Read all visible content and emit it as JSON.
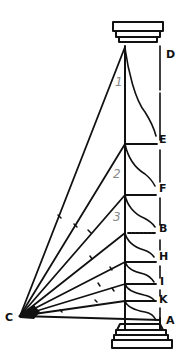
{
  "diagram": {
    "colors": {
      "ink": "#111111",
      "numerals": "#8a8a8a",
      "background": "#ffffff"
    },
    "vertex": {
      "label": "C",
      "x": 20,
      "y": 316
    },
    "column": {
      "axis_x": 125,
      "right_x": 160,
      "top_y": 47,
      "bottom_y": 330,
      "capital": {
        "x": 113,
        "y": 22,
        "width": 50,
        "height": 26
      },
      "base": {
        "x": 112,
        "y": 328,
        "width": 62,
        "height": 28
      }
    },
    "point_labels": [
      {
        "id": "D",
        "text": "D",
        "x": 166,
        "y": 58
      },
      {
        "id": "E",
        "text": "E",
        "x": 159,
        "y": 143
      },
      {
        "id": "F",
        "text": "F",
        "x": 159,
        "y": 192
      },
      {
        "id": "B",
        "text": "B",
        "x": 159,
        "y": 232
      },
      {
        "id": "H",
        "text": "H",
        "x": 159,
        "y": 260
      },
      {
        "id": "I",
        "text": "I",
        "x": 160,
        "y": 285
      },
      {
        "id": "K",
        "text": "K",
        "x": 159,
        "y": 303
      },
      {
        "id": "A",
        "text": "A",
        "x": 166,
        "y": 324
      },
      {
        "id": "C",
        "text": "C",
        "x": 5,
        "y": 321
      }
    ],
    "numerals": [
      {
        "text": "1",
        "x": 115,
        "y": 86
      },
      {
        "text": "2",
        "x": 114,
        "y": 178
      },
      {
        "text": "3",
        "x": 114,
        "y": 221
      }
    ],
    "rays_to_axis_y": [
      48,
      144,
      195,
      233,
      262,
      284,
      301
    ],
    "horizontal_ticks_y": [
      144,
      195,
      233,
      262,
      284,
      301
    ],
    "baseline_y": 318
  }
}
